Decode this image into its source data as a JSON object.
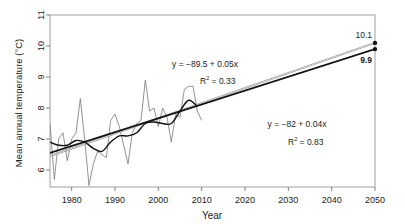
{
  "chart_data": {
    "type": "line",
    "title": "",
    "xlabel": "Year",
    "ylabel": "Mean annual temperature (°C)",
    "xlim": [
      1975,
      2050
    ],
    "ylim": [
      5.5,
      11
    ],
    "x_ticks": [
      1980,
      1990,
      2000,
      2010,
      2020,
      2030,
      2040,
      2050
    ],
    "y_ticks": [
      6,
      7,
      8,
      9,
      10,
      11
    ],
    "grid": false,
    "legend": "none",
    "series": [
      {
        "name": "Observed annual mean",
        "style": "thin grey line",
        "x": [
          1975,
          1976,
          1977,
          1978,
          1979,
          1980,
          1981,
          1982,
          1983,
          1984,
          1985,
          1986,
          1987,
          1988,
          1989,
          1990,
          1991,
          1992,
          1993,
          1994,
          1995,
          1996,
          1997,
          1998,
          1999,
          2000,
          2001,
          2002,
          2003,
          2004,
          2005,
          2006,
          2007,
          2008,
          2009,
          2010
        ],
        "values": [
          7.5,
          5.7,
          7.0,
          7.2,
          6.3,
          7.0,
          7.2,
          8.3,
          7.0,
          5.5,
          6.2,
          6.6,
          6.5,
          6.4,
          7.6,
          7.8,
          7.4,
          6.8,
          6.2,
          7.2,
          7.5,
          7.6,
          8.9,
          7.9,
          8.0,
          7.4,
          8.0,
          7.7,
          6.9,
          7.8,
          7.7,
          8.6,
          8.7,
          8.7,
          7.9,
          7.6
        ]
      },
      {
        "name": "Smoothed trend",
        "style": "thick black curve",
        "x": [
          1975,
          1977,
          1979,
          1981,
          1983,
          1985,
          1987,
          1989,
          1991,
          1993,
          1995,
          1997,
          1999,
          2001,
          2003,
          2005,
          2007,
          2009
        ],
        "values": [
          6.9,
          6.8,
          6.8,
          6.95,
          6.9,
          6.7,
          6.6,
          6.9,
          7.1,
          7.1,
          7.2,
          7.5,
          7.55,
          7.5,
          7.5,
          7.9,
          8.25,
          8.05
        ]
      },
      {
        "name": "Linear fit A (extrapolated)",
        "style": "thin grey straight line",
        "equation": "y = −89.5 + 0.05x",
        "r2_label": "R² = 0.33",
        "x": [
          1975,
          2050
        ],
        "values": [
          6.45,
          10.1
        ]
      },
      {
        "name": "Linear fit B (extrapolated)",
        "style": "thick black straight line",
        "equation": "y = −82 + 0.04x",
        "r2_label": "R² = 0.83",
        "x": [
          1975,
          2050
        ],
        "values": [
          6.55,
          9.9
        ]
      }
    ],
    "annotations": [
      {
        "text": "y = −89.5 + 0.05x",
        "x": 2003,
        "y": 9.25
      },
      {
        "text": "R² = 0.33",
        "x": 2005,
        "y": 8.85
      },
      {
        "text": "y = −82 + 0.04x",
        "x": 2023,
        "y": 7.55
      },
      {
        "text": "R² = 0.83",
        "x": 2024,
        "y": 6.95
      },
      {
        "text": "10.1",
        "x": 2050,
        "y": 10.1,
        "marker": "point"
      },
      {
        "text": "9.9",
        "x": 2050,
        "y": 9.9,
        "marker": "point"
      }
    ]
  },
  "labels": {
    "xlabel": "Year",
    "ylabel": "Mean annual temperature (°C)",
    "eq_a": "y = −89.5 + 0.05x",
    "r2_a_prefix": "R",
    "r2_a_sup": "2",
    "r2_a_val": " = 0.33",
    "eq_b": "y = −82 + 0.04x",
    "r2_b_prefix": "R",
    "r2_b_sup": "2",
    "r2_b_val": " = 0.83",
    "end_a": "10.1",
    "end_b": "9.9"
  }
}
